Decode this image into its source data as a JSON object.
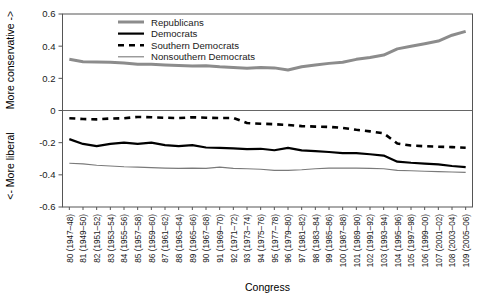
{
  "chart_data": {
    "type": "line",
    "title": "",
    "xlabel": "Congress",
    "ylabel_top": "More conservative ->",
    "ylabel_bottom": "<- More liberal",
    "ylim": [
      -0.6,
      0.6
    ],
    "yticks": [
      0.6,
      0.4,
      0.2,
      0,
      -0.2,
      -0.4,
      -0.6
    ],
    "ytick_labels": [
      "0.6",
      "0.4",
      "0.2",
      "0",
      "-0.2",
      "-0.4",
      "-0.6"
    ],
    "grid": false,
    "zero_line": true,
    "legend_position": "top-center",
    "categories": [
      "80 (1947–48)",
      "81 (1949–50)",
      "82 (1951–52)",
      "83 (1953–54)",
      "84 (1955–56)",
      "85 (1957–58)",
      "86 (1959–60)",
      "87 (1961–62)",
      "88 (1963–64)",
      "89 (1965–66)",
      "90 (1967–68)",
      "91 (1969–70)",
      "92 (1971–72)",
      "93 (1973–74)",
      "94 (1975–76)",
      "95 (1977–78)",
      "96 (1979–80)",
      "97 (1981–82)",
      "98 (1983–84)",
      "99 (1985–86)",
      "100 (1987–88)",
      "101 (1989–90)",
      "102 (1991–92)",
      "103 (1993–94)",
      "104 (1995–96)",
      "105 (1997–98)",
      "106 (1999–00)",
      "107 (2001–02)",
      "108 (2003–04)",
      "109 (2005–06)"
    ],
    "series": [
      {
        "name": "Republicans",
        "style": "thick-gray",
        "color": "#8c8c8c",
        "width": 3.0,
        "dash": "none",
        "values": [
          0.318,
          0.303,
          0.302,
          0.3,
          0.295,
          0.288,
          0.287,
          0.283,
          0.28,
          0.276,
          0.278,
          0.272,
          0.268,
          0.262,
          0.268,
          0.265,
          0.252,
          0.272,
          0.283,
          0.293,
          0.3,
          0.318,
          0.33,
          0.345,
          0.383,
          0.4,
          0.415,
          0.432,
          0.468,
          0.492
        ]
      },
      {
        "name": "Democrats",
        "style": "thick-black",
        "color": "#000000",
        "width": 2.2,
        "dash": "none",
        "values": [
          -0.178,
          -0.208,
          -0.222,
          -0.208,
          -0.2,
          -0.207,
          -0.2,
          -0.215,
          -0.222,
          -0.215,
          -0.23,
          -0.232,
          -0.235,
          -0.24,
          -0.238,
          -0.247,
          -0.232,
          -0.248,
          -0.252,
          -0.258,
          -0.265,
          -0.265,
          -0.272,
          -0.28,
          -0.318,
          -0.325,
          -0.33,
          -0.335,
          -0.345,
          -0.352
        ]
      },
      {
        "name": "Southern Democrats",
        "style": "dashed-black",
        "color": "#000000",
        "width": 2.6,
        "dash": "6,5",
        "values": [
          -0.048,
          -0.053,
          -0.055,
          -0.05,
          -0.048,
          -0.04,
          -0.042,
          -0.045,
          -0.047,
          -0.042,
          -0.045,
          -0.047,
          -0.046,
          -0.078,
          -0.082,
          -0.085,
          -0.09,
          -0.097,
          -0.1,
          -0.102,
          -0.108,
          -0.12,
          -0.13,
          -0.142,
          -0.205,
          -0.218,
          -0.222,
          -0.225,
          -0.228,
          -0.232
        ]
      },
      {
        "name": "Nonsouthern Democrats",
        "style": "thin-gray",
        "color": "#7a7a7a",
        "width": 1.1,
        "dash": "none",
        "values": [
          -0.328,
          -0.332,
          -0.34,
          -0.345,
          -0.35,
          -0.352,
          -0.355,
          -0.358,
          -0.36,
          -0.358,
          -0.36,
          -0.352,
          -0.36,
          -0.362,
          -0.365,
          -0.372,
          -0.372,
          -0.368,
          -0.362,
          -0.358,
          -0.358,
          -0.358,
          -0.36,
          -0.362,
          -0.372,
          -0.375,
          -0.378,
          -0.38,
          -0.382,
          -0.385
        ]
      }
    ]
  },
  "legend": {
    "items": [
      {
        "label": "Republicans"
      },
      {
        "label": "Democrats"
      },
      {
        "label": "Southern Democrats"
      },
      {
        "label": "Nonsouthern Democrats"
      }
    ]
  }
}
